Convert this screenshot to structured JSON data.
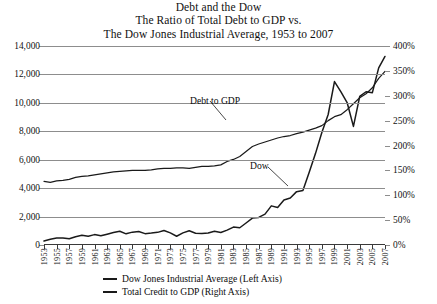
{
  "title": {
    "line1": "Debt and the Dow",
    "line2": "The Ratio of Total Debt to GDP vs.",
    "line3": "The Dow Jones Industrial Average, 1953 to 2007"
  },
  "annotations": {
    "debt_label": "Debt to GDP",
    "dow_label": "Dow"
  },
  "legend": {
    "items": [
      {
        "label": "Dow Jones Industrial Average (Left Axis)",
        "color": "#1a1a1a"
      },
      {
        "label": "Total Credit to GDP (Right Axis)",
        "color": "#1a1a1a"
      }
    ]
  },
  "axes": {
    "left_ticks": [
      "0",
      "2,000",
      "4,000",
      "6,000",
      "8,000",
      "10,000",
      "12,000",
      "14,000"
    ],
    "right_ticks": [
      "0%",
      "50%",
      "100%",
      "150%",
      "200%",
      "250%",
      "300%",
      "350%",
      "400%"
    ],
    "x_ticks": [
      "1953",
      "1955",
      "1957",
      "1959",
      "1961",
      "1963",
      "1965",
      "1967",
      "1969",
      "1971",
      "1973",
      "1975",
      "1977",
      "1979",
      "1981",
      "1983",
      "1985",
      "1987",
      "1989",
      "1991",
      "1993",
      "1995",
      "1997",
      "1999",
      "2001",
      "2003",
      "2005",
      "2007"
    ]
  },
  "colors": {
    "grid": "#8d8d8d",
    "axis": "#3a3a3a",
    "series": "#1a1a1a",
    "background": "#ffffff"
  },
  "chart_data": {
    "type": "line",
    "xlabel": "",
    "grid": true,
    "legend_position": "bottom",
    "x": [
      1953,
      1954,
      1955,
      1956,
      1957,
      1958,
      1959,
      1960,
      1961,
      1962,
      1963,
      1964,
      1965,
      1966,
      1967,
      1968,
      1969,
      1970,
      1971,
      1972,
      1973,
      1974,
      1975,
      1976,
      1977,
      1978,
      1979,
      1980,
      1981,
      1982,
      1983,
      1984,
      1985,
      1986,
      1987,
      1988,
      1989,
      1990,
      1991,
      1992,
      1993,
      1994,
      1995,
      1996,
      1997,
      1998,
      1999,
      2000,
      2001,
      2002,
      2003,
      2004,
      2005,
      2006,
      2007
    ],
    "series": [
      {
        "name": "Dow Jones Industrial Average (Left Axis)",
        "axis": "left",
        "ylabel": "Dow Jones Industrial Average",
        "ylim": [
          0,
          14000
        ],
        "values": [
          280,
          404,
          488,
          499,
          436,
          584,
          679,
          616,
          731,
          652,
          763,
          874,
          969,
          786,
          905,
          944,
          800,
          839,
          890,
          1020,
          851,
          616,
          852,
          1005,
          831,
          805,
          839,
          964,
          875,
          1047,
          1259,
          1212,
          1547,
          1896,
          1939,
          2169,
          2753,
          2634,
          3169,
          3301,
          3754,
          3834,
          5117,
          6448,
          7908,
          9181,
          11497,
          10788,
          10022,
          8342,
          10454,
          10783,
          10718,
          12463,
          13265
        ]
      },
      {
        "name": "Total Credit to GDP (Right Axis)",
        "axis": "right",
        "ylabel": "Total Credit to GDP",
        "ylim": [
          0,
          400
        ],
        "unit": "%",
        "values": [
          128,
          126,
          129,
          130,
          132,
          136,
          138,
          139,
          141,
          143,
          145,
          147,
          148,
          149,
          150,
          150,
          150,
          151,
          153,
          154,
          154,
          155,
          155,
          154,
          156,
          158,
          158,
          159,
          161,
          168,
          172,
          178,
          188,
          198,
          203,
          207,
          211,
          215,
          218,
          220,
          224,
          227,
          231,
          235,
          240,
          250,
          258,
          262,
          272,
          284,
          296,
          304,
          316,
          335,
          349
        ]
      }
    ]
  }
}
